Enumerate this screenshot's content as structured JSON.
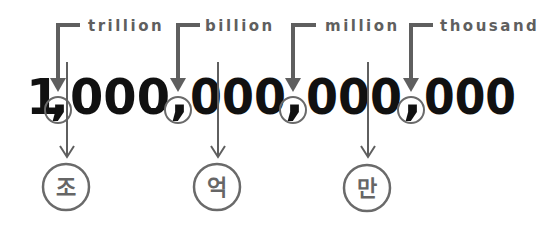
{
  "number": {
    "groups": [
      "1",
      "000",
      "000",
      "000",
      "000"
    ],
    "comma": ","
  },
  "place_labels": [
    {
      "label": "trillion",
      "comma_index": 0
    },
    {
      "label": "billion",
      "comma_index": 1
    },
    {
      "label": "million",
      "comma_index": 2
    },
    {
      "label": "thousand",
      "comma_index": 3
    }
  ],
  "korean_units": [
    {
      "label": "조",
      "meaning": "trillion"
    },
    {
      "label": "억",
      "meaning": "hundred million"
    },
    {
      "label": "만",
      "meaning": "ten thousand"
    }
  ],
  "colors": {
    "line": "#5f5f5f",
    "digits": "#111111",
    "circle": "#6a6a6a"
  }
}
